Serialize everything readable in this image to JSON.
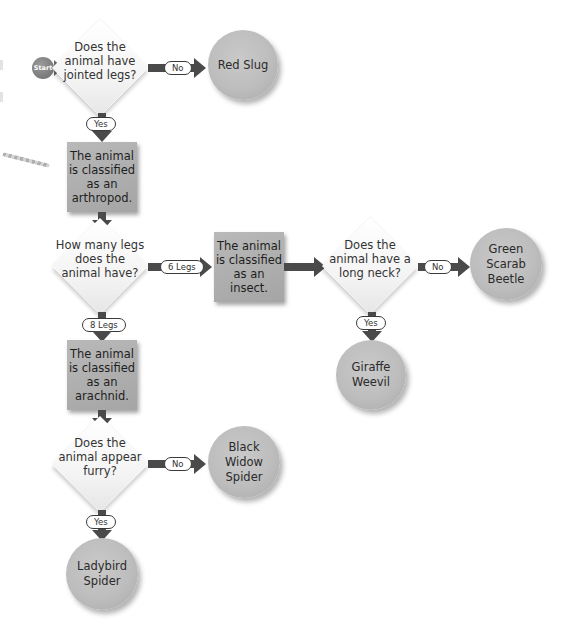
{
  "flowchart": {
    "start": {
      "label": "Start"
    },
    "questions": [
      {
        "id": "q1",
        "text": "Does the animal have jointed legs?"
      },
      {
        "id": "q2",
        "text": "How many legs does the animal have?"
      },
      {
        "id": "q3",
        "text": "Does the animal have a long neck?"
      },
      {
        "id": "q4",
        "text": "Does the animal appear furry?"
      }
    ],
    "classifications": [
      {
        "id": "c1",
        "text": "The animal is classified as an arthropod."
      },
      {
        "id": "c2",
        "text": "The animal is classified as an insect."
      },
      {
        "id": "c3",
        "text": "The animal is classified as an arachnid."
      }
    ],
    "results": [
      {
        "id": "r1",
        "text": "Red Slug"
      },
      {
        "id": "r2",
        "text": "Green Scarab Beetle"
      },
      {
        "id": "r3",
        "text": "Giraffe Weevil"
      },
      {
        "id": "r4",
        "text": "Black Widow Spider"
      },
      {
        "id": "r5",
        "text": "Ladybird Spider"
      }
    ],
    "edge_labels": {
      "q1_no": "No",
      "q1_yes": "Yes",
      "q2_six": "6 Legs",
      "q2_eight": "8 Legs",
      "q3_no": "No",
      "q3_yes": "Yes",
      "q4_no": "No",
      "q4_yes": "Yes"
    },
    "colors": {
      "connector": "#4a4a4a",
      "box": "#ababab",
      "circle": "#bdbdbd",
      "diamond": "#f4f4f4"
    }
  }
}
